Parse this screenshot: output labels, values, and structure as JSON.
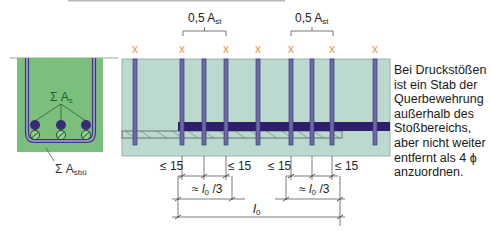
{
  "diagram": {
    "colors": {
      "section_fill": "#7cbf7c",
      "elevation_fill": "#bcd9cf",
      "stirrup": "#6b6aa6",
      "main_bar": "#2e1f6b",
      "marker": "#e39a4e",
      "dim_line": "#333333",
      "label_green": "#1f5f2a"
    },
    "cross_section": {
      "label_main_bars": "Σ A",
      "label_main_bars_sub": "s",
      "label_stirrups": "Σ A",
      "label_stirrups_sub": "sbü"
    },
    "elevation": {
      "top_labels": [
        {
          "text": "0,5 A",
          "sub": "st"
        },
        {
          "text": "0,5 A",
          "sub": "st"
        }
      ],
      "marker_glyph": "x",
      "marker_positions_x": [
        135,
        182,
        226,
        258,
        291,
        332,
        375
      ],
      "stirrup_positions_x": [
        135,
        182,
        204,
        226,
        258,
        291,
        312,
        332,
        375
      ]
    },
    "dimensions": {
      "le15_labels": [
        "≤ 15",
        "≤ 15",
        "≤ 15",
        "≤ 15"
      ],
      "third_labels": [
        {
          "prefix": "≈ ",
          "var": "l",
          "sub": "0",
          "suffix": " /3"
        },
        {
          "prefix": "≈ ",
          "var": "l",
          "sub": "0",
          "suffix": " /3"
        }
      ],
      "total_label": {
        "var": "l",
        "sub": "0"
      }
    },
    "note": "Bei Druckstößen ist ein Stab der Querbewehrung außerhalb des Stoßbereichs, aber nicht weiter entfernt als 4 ϕ anzuordnen."
  }
}
